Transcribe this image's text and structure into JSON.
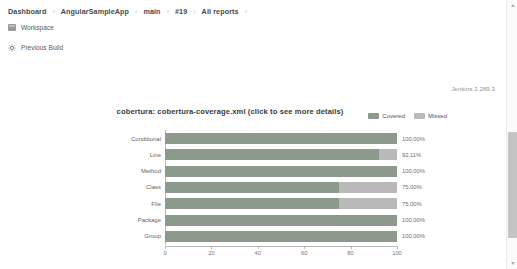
{
  "breadcrumb": {
    "items": [
      {
        "label": "Dashboard"
      },
      {
        "label": "AngularSampleApp"
      },
      {
        "label": "main"
      },
      {
        "label": "#19"
      },
      {
        "label": "All reports"
      }
    ],
    "separator": "›"
  },
  "tasks": [
    {
      "label": "Workspace",
      "icon": "folder-icon"
    },
    {
      "label": "Previous Build",
      "icon": "gear-icon"
    }
  ],
  "footer": {
    "version": "Jenkins 2.289.3"
  },
  "chart_data": {
    "type": "bar",
    "orientation": "horizontal",
    "title": "cobertura: cobertura-coverage.xml (click to see more details)",
    "xlabel": "",
    "ylabel": "",
    "xlim": [
      0,
      100
    ],
    "xticks": [
      0,
      20,
      40,
      60,
      80,
      100
    ],
    "grid": false,
    "legend_position": "top-right",
    "categories": [
      "Conditional",
      "Line",
      "Method",
      "Class",
      "File",
      "Package",
      "Group"
    ],
    "series": [
      {
        "name": "Covered",
        "color": "#8c9a8c",
        "values": [
          100.0,
          92.11,
          100.0,
          75.0,
          75.0,
          100.0,
          100.0
        ]
      },
      {
        "name": "Missed",
        "color": "#b9b9b9",
        "values": [
          0.0,
          7.89,
          0.0,
          25.0,
          25.0,
          0.0,
          0.0
        ]
      }
    ],
    "data_labels": [
      "100.00%",
      "92.11%",
      "100.00%",
      "75.00%",
      "75.00%",
      "100.00%",
      "100.00%"
    ]
  },
  "colors": {
    "covered": "#8c9a8c",
    "missed": "#b9b9b9",
    "breadcrumb_text": "#4a4a4a",
    "axis": "#b8b8b8"
  },
  "scrollbar": {
    "up_arrow": "scroll-up-arrow",
    "down_arrow": "scroll-down-arrow"
  }
}
